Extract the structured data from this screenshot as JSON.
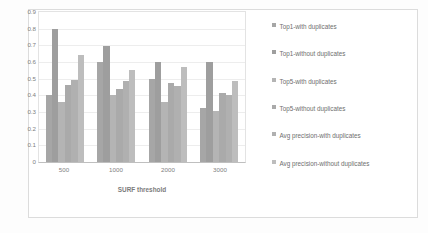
{
  "chart_data": {
    "type": "bar",
    "title": "",
    "xlabel": "SURF threshold",
    "ylabel": "Matching precision",
    "categories": [
      "500",
      "1000",
      "2000",
      "3000"
    ],
    "ylim": [
      0,
      0.9
    ],
    "y_ticks": [
      "0.9",
      "0.8",
      "0.7",
      "0.6",
      "0.5",
      "0.4",
      "0.3",
      "0.2",
      "0.1",
      "0"
    ],
    "y_tick_values": [
      0.9,
      0.8,
      0.7,
      0.6,
      0.5,
      0.4,
      0.3,
      0.2,
      0.1,
      0
    ],
    "grid": true,
    "legend_position": "right",
    "series": [
      {
        "name": "Top1-with duplicates",
        "color": "#a6a6a6",
        "values": [
          0.4,
          0.6,
          0.5,
          0.325
        ]
      },
      {
        "name": "Top1-without duplicates",
        "color": "#9e9e9e",
        "values": [
          0.8,
          0.695,
          0.6,
          0.6
        ]
      },
      {
        "name": "Top5-with duplicates",
        "color": "#b4b4b4",
        "values": [
          0.36,
          0.4,
          0.36,
          0.305
        ]
      },
      {
        "name": "Top5-without duplicates",
        "color": "#aaaaaa",
        "values": [
          0.46,
          0.44,
          0.475,
          0.415
        ]
      },
      {
        "name": "Avg precision-with duplicates",
        "color": "#b0b0b0",
        "values": [
          0.49,
          0.485,
          0.455,
          0.4
        ]
      },
      {
        "name": "Avg precision-without duplicates",
        "color": "#bdbdbd",
        "values": [
          0.645,
          0.555,
          0.57,
          0.485
        ]
      }
    ]
  }
}
